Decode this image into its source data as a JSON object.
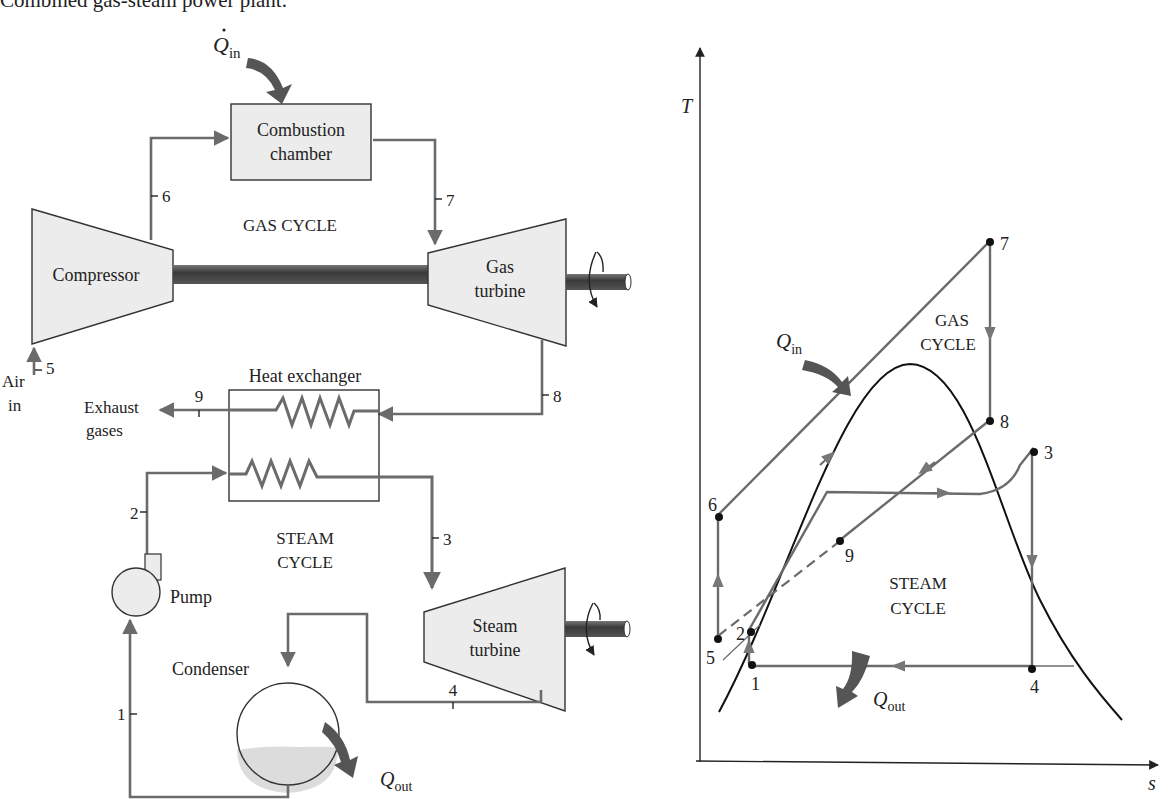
{
  "caption": "Combined gas-steam power plant.",
  "schematic": {
    "q_in": {
      "symbol": "Q",
      "sub": "in"
    },
    "q_out": {
      "symbol": "Q",
      "sub": "out"
    },
    "combustion_chamber": [
      "Combustion",
      "chamber"
    ],
    "compressor": "Compressor",
    "gas_turbine": [
      "Gas",
      "turbine"
    ],
    "gas_cycle": "GAS CYCLE",
    "air_in": [
      "Air",
      "in"
    ],
    "heat_exchanger": "Heat exchanger",
    "exhaust": [
      "Exhaust",
      "gases"
    ],
    "steam_cycle": [
      "STEAM",
      "CYCLE"
    ],
    "pump": "Pump",
    "condenser": "Condenser",
    "steam_turbine": [
      "Steam",
      "turbine"
    ],
    "states": {
      "s1": "1",
      "s2": "2",
      "s3": "3",
      "s4": "4",
      "s5": "5",
      "s6": "6",
      "s7": "7",
      "s8": "8",
      "s9": "9"
    }
  },
  "ts_diagram": {
    "y_axis": "T",
    "x_axis": "s",
    "gas_cycle": [
      "GAS",
      "CYCLE"
    ],
    "steam_cycle": [
      "STEAM",
      "CYCLE"
    ],
    "q_in": {
      "symbol": "Q",
      "sub": "in"
    },
    "q_out": {
      "symbol": "Q",
      "sub": "out"
    },
    "points": {
      "p1": "1",
      "p2": "2",
      "p3": "3",
      "p4": "4",
      "p5": "5",
      "p6": "6",
      "p7": "7",
      "p8": "8",
      "p9": "9"
    }
  },
  "colors": {
    "flow": "#6b6b6b",
    "component_fill": "#ececec",
    "shaft": "#4a4a4a",
    "heat_arrow": "#555555"
  }
}
